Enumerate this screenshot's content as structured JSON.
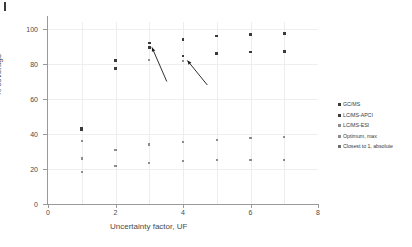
{
  "chart_data": {
    "type": "scatter",
    "title": "",
    "xlabel": "Uncertainty factor, UF",
    "ylabel": "% coverage",
    "xlim": [
      0,
      8
    ],
    "ylim": [
      0,
      108
    ],
    "xticks": [
      0,
      2,
      4,
      6,
      8
    ],
    "yticks": [
      0,
      20,
      40,
      60,
      80,
      100
    ],
    "grid": true,
    "legend_position": "right",
    "series": [
      {
        "name": "GC/MS",
        "color": "#3a3a3a",
        "x": [
          1,
          2,
          3,
          4,
          5,
          6,
          7
        ],
        "y": [
          43.5,
          82.0,
          92.0,
          94.0,
          96.0,
          97.0,
          97.5
        ]
      },
      {
        "name": "LC/MS-APCI",
        "color": "#3a3a3a",
        "x": [
          1,
          2,
          3,
          4,
          5,
          6,
          7
        ],
        "y": [
          42.5,
          77.5,
          89.5,
          84.5,
          86.0,
          86.8,
          87.0
        ]
      },
      {
        "name": "LC/MS-ESI",
        "color": "#8c8c8c",
        "x": [
          1,
          2,
          3,
          4,
          5,
          6,
          7
        ],
        "y": [
          36.0,
          30.8,
          34.0,
          35.5,
          36.7,
          37.5,
          38.2
        ]
      },
      {
        "name": "Optimum, max",
        "color": "#8c8c8c",
        "x": [
          1,
          2,
          3,
          4,
          5,
          6,
          7
        ],
        "y": [
          26.0,
          21.7,
          23.3,
          24.4,
          25.0,
          25.1,
          25.3
        ]
      },
      {
        "name": "Closest to 1, absolute",
        "color": "#8c8c8c",
        "x": [
          1,
          3,
          4
        ],
        "y": [
          18.2,
          82.5,
          81.5
        ]
      }
    ],
    "annotations": [
      {
        "label": "arrow-1",
        "x1": 3.52,
        "y1": 70.0,
        "x2": 3.08,
        "y2": 89.5
      },
      {
        "label": "arrow-2",
        "x1": 4.72,
        "y1": 68.0,
        "x2": 4.13,
        "y2": 82.0
      }
    ]
  },
  "axes": {
    "ylabel": "% coverage",
    "xlabel": "Uncertainty factor, UF",
    "yticks": [
      "0",
      "20",
      "40",
      "60",
      "80",
      "100"
    ],
    "xticks": [
      "0",
      "2",
      "4",
      "6",
      "8"
    ]
  },
  "legend": {
    "items": [
      {
        "label": "GC/MS",
        "color": "#3a3a3a"
      },
      {
        "label": "LC/MS-APCI",
        "color": "#3a3a3a"
      },
      {
        "label": "LC/MS-ESI",
        "color": "#8c8c8c"
      },
      {
        "label": "Optimum, max",
        "color": "#8c8c8c"
      },
      {
        "label": "Closest to 1, absolute",
        "color": "#6e6e6e"
      }
    ]
  }
}
